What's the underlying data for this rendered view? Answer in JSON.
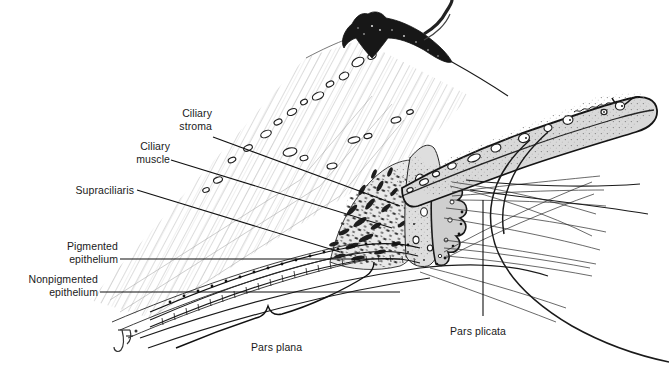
{
  "figure": {
    "background_color": "#ffffff",
    "ink_color": "#1a1a1a",
    "signature": "JF"
  },
  "labels": {
    "ciliary_stroma": "Ciliary\nstroma",
    "ciliary_muscle": "Ciliary\nmuscle",
    "supraciliaris": "Supraciliaris",
    "pigmented_epithelium": "Pigmented\nepithelium",
    "nonpigmented_epithelium": "Nonpigmented\nepithelium",
    "pars_plana": "Pars plana",
    "pars_plicata": "Pars plicata"
  },
  "structures": [
    {
      "name": "sclera",
      "description": "fine diagonal hatching, upper left band"
    },
    {
      "name": "ciliary-muscle",
      "description": "dark stippled fusiform bundles"
    },
    {
      "name": "ciliary-processes",
      "description": "folded epithelial crests, pars plicata"
    },
    {
      "name": "iris",
      "description": "tapering gray band to the right with pupillary margin"
    },
    {
      "name": "zonular-fibers",
      "description": "fine fibers fanning toward lens"
    },
    {
      "name": "lens",
      "description": "large curved profile at right"
    },
    {
      "name": "pigmented-epithelium",
      "description": "dark beaded cell row"
    },
    {
      "name": "nonpigmented-epithelium",
      "description": "light cuboidal cell row"
    }
  ]
}
